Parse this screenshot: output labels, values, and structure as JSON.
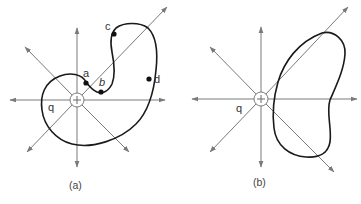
{
  "figure": {
    "panels": [
      {
        "id": "a",
        "caption": "(a)",
        "charge_label": "q",
        "charge_sign": "+",
        "point_labels": [
          "a",
          "b",
          "c",
          "d"
        ],
        "description": "Positive point charge q with radial field lines; closed irregular surface winding around with points a, b, c, d where it crosses field lines"
      },
      {
        "id": "b",
        "caption": "(b)",
        "charge_label": "q",
        "charge_sign": "+",
        "description": "Positive point charge q with radial field lines; closed kidney-shaped surface that does not enclose the charge"
      }
    ],
    "colors": {
      "field_lines": "#7a7a7a",
      "surface": "#1a1a1a",
      "text": "#333333"
    }
  }
}
